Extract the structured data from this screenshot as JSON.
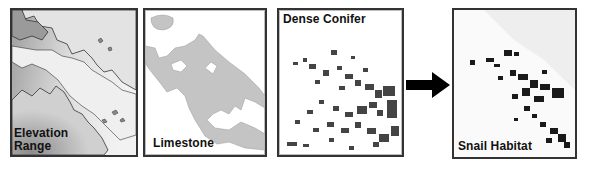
{
  "diagram": {
    "type": "gis-overlay-flow",
    "panels": [
      {
        "id": "elevation",
        "label_line1": "Elevation",
        "label_line2": "Range",
        "fill": "#b9b9b9",
        "style": "shaded-relief-with-outlined-polygons"
      },
      {
        "id": "limestone",
        "label": "Limestone",
        "fill": "#c4c4c4",
        "style": "light-gray-polygons"
      },
      {
        "id": "conifer",
        "label": "Dense Conifer",
        "fill": "#444444",
        "style": "scattered-dark-patches"
      },
      {
        "id": "habitat",
        "label": "Snail Habitat",
        "fill": "#1a1a1a",
        "style": "dark-patches-on-faint-background"
      }
    ],
    "arrow": {
      "direction": "right",
      "from": "conifer",
      "to": "habitat",
      "color": "#000000"
    }
  }
}
